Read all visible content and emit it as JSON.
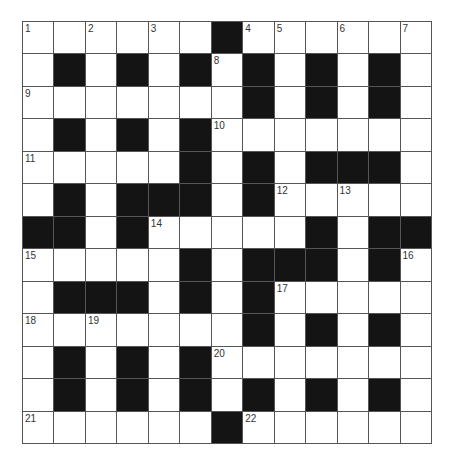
{
  "puzzle": {
    "rows": 13,
    "cols": 13,
    "colors": {
      "block": "#141414",
      "cell": "#ffffff",
      "line": "#555555"
    },
    "grid": [
      "......#......",
      ".#.#.#.#.#.#.",
      ".......#.#.#.",
      ".#.#.#.......",
      ".....#.#.###.",
      ".#.###.#.....",
      "##.#.....#.##",
      ".....#.###.#.",
      ".###.#.#.....",
      ".......#.#.#.",
      ".#.#.#.......",
      ".#.#.#.#.#.#.",
      "......#......"
    ],
    "numbers": [
      {
        "r": 0,
        "c": 0,
        "n": "1"
      },
      {
        "r": 0,
        "c": 2,
        "n": "2"
      },
      {
        "r": 0,
        "c": 4,
        "n": "3"
      },
      {
        "r": 0,
        "c": 7,
        "n": "4"
      },
      {
        "r": 0,
        "c": 8,
        "n": "5"
      },
      {
        "r": 0,
        "c": 10,
        "n": "6"
      },
      {
        "r": 0,
        "c": 12,
        "n": "7"
      },
      {
        "r": 1,
        "c": 6,
        "n": "8"
      },
      {
        "r": 2,
        "c": 0,
        "n": "9"
      },
      {
        "r": 3,
        "c": 6,
        "n": "10"
      },
      {
        "r": 4,
        "c": 0,
        "n": "11"
      },
      {
        "r": 5,
        "c": 8,
        "n": "12"
      },
      {
        "r": 5,
        "c": 10,
        "n": "13"
      },
      {
        "r": 6,
        "c": 4,
        "n": "14"
      },
      {
        "r": 7,
        "c": 0,
        "n": "15"
      },
      {
        "r": 7,
        "c": 12,
        "n": "16"
      },
      {
        "r": 8,
        "c": 8,
        "n": "17"
      },
      {
        "r": 9,
        "c": 0,
        "n": "18"
      },
      {
        "r": 9,
        "c": 2,
        "n": "19"
      },
      {
        "r": 10,
        "c": 6,
        "n": "20"
      },
      {
        "r": 12,
        "c": 0,
        "n": "21"
      },
      {
        "r": 12,
        "c": 7,
        "n": "22"
      }
    ]
  }
}
